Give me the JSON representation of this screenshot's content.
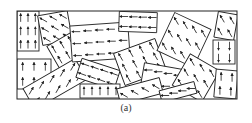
{
  "figure": {
    "caption": "(a)",
    "stroke_color": "#222222",
    "frame": {
      "x": 17,
      "y": 11,
      "w": 220,
      "h": 88
    },
    "grains": [
      {
        "cx": 28,
        "cy": 31,
        "w": 22,
        "h": 40,
        "angle": 0,
        "dir": -90,
        "rows": 3,
        "cols": 3
      },
      {
        "cx": 34,
        "cy": 74,
        "w": 34,
        "h": 30,
        "angle": 0,
        "dir": -90,
        "rows": 2,
        "cols": 3
      },
      {
        "cx": 55,
        "cy": 28,
        "w": 30,
        "h": 30,
        "angle": -10,
        "dir": -150,
        "rows": 3,
        "cols": 3
      },
      {
        "cx": 68,
        "cy": 55,
        "w": 28,
        "h": 36,
        "angle": -30,
        "dir": -120,
        "rows": 3,
        "cols": 3
      },
      {
        "cx": 55,
        "cy": 84,
        "w": 60,
        "h": 24,
        "angle": -30,
        "dir": -60,
        "rows": 2,
        "cols": 5
      },
      {
        "cx": 100,
        "cy": 42,
        "w": 58,
        "h": 36,
        "angle": -4,
        "dir": 180,
        "rows": 3,
        "cols": 5
      },
      {
        "cx": 98,
        "cy": 74,
        "w": 40,
        "h": 20,
        "angle": 18,
        "dir": -160,
        "rows": 2,
        "cols": 4
      },
      {
        "cx": 100,
        "cy": 91,
        "w": 40,
        "h": 14,
        "angle": 0,
        "dir": -90,
        "rows": 1,
        "cols": 5
      },
      {
        "cx": 138,
        "cy": 22,
        "w": 38,
        "h": 20,
        "angle": 2,
        "dir": 180,
        "rows": 2,
        "cols": 4
      },
      {
        "cx": 140,
        "cy": 62,
        "w": 44,
        "h": 34,
        "angle": -20,
        "dir": -120,
        "rows": 3,
        "cols": 4
      },
      {
        "cx": 162,
        "cy": 79,
        "w": 40,
        "h": 26,
        "angle": 10,
        "dir": 180,
        "rows": 2,
        "cols": 4
      },
      {
        "cx": 140,
        "cy": 91,
        "w": 44,
        "h": 16,
        "angle": -15,
        "dir": -150,
        "rows": 1,
        "cols": 4
      },
      {
        "cx": 184,
        "cy": 40,
        "w": 40,
        "h": 42,
        "angle": 25,
        "dir": -120,
        "rows": 3,
        "cols": 4
      },
      {
        "cx": 196,
        "cy": 78,
        "w": 34,
        "h": 36,
        "angle": 30,
        "dir": -120,
        "rows": 3,
        "cols": 3
      },
      {
        "cx": 178,
        "cy": 92,
        "w": 36,
        "h": 12,
        "angle": -15,
        "dir": 180,
        "rows": 1,
        "cols": 4
      },
      {
        "cx": 226,
        "cy": 26,
        "w": 20,
        "h": 26,
        "angle": 10,
        "dir": -120,
        "rows": 2,
        "cols": 2
      },
      {
        "cx": 224,
        "cy": 52,
        "w": 22,
        "h": 24,
        "angle": 0,
        "dir": 90,
        "rows": 2,
        "cols": 2
      },
      {
        "cx": 226,
        "cy": 84,
        "w": 22,
        "h": 28,
        "angle": 5,
        "dir": -90,
        "rows": 2,
        "cols": 2
      }
    ]
  }
}
